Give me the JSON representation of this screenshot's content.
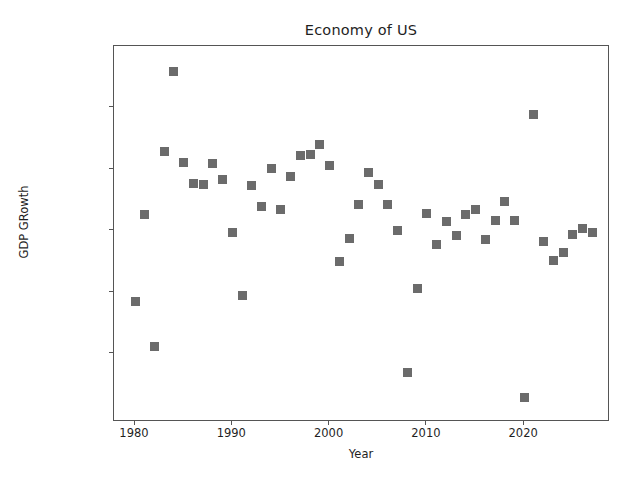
{
  "figure": {
    "background": "#ffffff",
    "marker_color": "#6b6b6b",
    "axis_color": "#555555",
    "text_color": "#1f1f1f"
  },
  "chart_data": {
    "type": "scatter",
    "title": "Economy of US",
    "xlabel": "Year",
    "ylabel": "GDP GRowth",
    "grid": false,
    "legend": null,
    "xlim": [
      1978.3,
      1978.3
    ],
    "ylim": [
      -0.0395,
      0.0795
    ],
    "xticks": [
      1980,
      1990,
      2000,
      2010,
      2020
    ],
    "xticklabels": [
      "1980",
      "1990",
      "2000",
      "2010",
      "2020"
    ],
    "yticks": [
      0.06,
      0.04,
      0.02,
      0.0,
      -0.02
    ],
    "yticklabels": [
      "0.06",
      "0.04",
      "0.02",
      "0.00",
      "−0.02"
    ],
    "marker": "square",
    "marker_size": 9,
    "x": [
      1980,
      1981,
      1982,
      1983,
      1984,
      1985,
      1986,
      1987,
      1988,
      1989,
      1990,
      1991,
      1992,
      1993,
      1994,
      1995,
      1996,
      1997,
      1998,
      1999,
      2000,
      2001,
      2002,
      2003,
      2004,
      2005,
      2006,
      2007,
      2008,
      2009,
      2010,
      2011,
      2012,
      2013,
      2014,
      2015,
      2016,
      2017,
      2018,
      2019,
      2020,
      2021,
      2022,
      2023,
      2024,
      2025,
      2026,
      2027
    ],
    "y": [
      -0.003,
      0.0251,
      -0.0177,
      0.0457,
      0.0718,
      0.0422,
      0.0352,
      0.0351,
      0.0419,
      0.0368,
      0.0195,
      -0.001,
      0.0347,
      0.0279,
      0.0403,
      0.0268,
      0.0377,
      0.0445,
      0.0449,
      0.0479,
      0.0413,
      0.0099,
      0.0174,
      0.0285,
      0.039,
      0.0351,
      0.0285,
      0.0201,
      -0.0261,
      0.0012,
      0.0257,
      0.0155,
      0.0229,
      0.0184,
      0.0252,
      0.0268,
      0.0171,
      0.0234,
      0.0295,
      0.0233,
      -0.0345,
      0.0579,
      0.0165,
      0.0104,
      0.0129,
      0.0187,
      0.0207,
      0.0194
    ],
    "points": [
      {
        "year": 1980,
        "value": -0.003
      },
      {
        "year": 1981,
        "value": 0.0251
      },
      {
        "year": 1982,
        "value": -0.0177
      },
      {
        "year": 1983,
        "value": 0.0457
      },
      {
        "year": 1984,
        "value": 0.0718
      },
      {
        "year": 1985,
        "value": 0.0422
      },
      {
        "year": 1986,
        "value": 0.0352
      },
      {
        "year": 1987,
        "value": 0.0351
      },
      {
        "year": 1988,
        "value": 0.0419
      },
      {
        "year": 1989,
        "value": 0.0368
      },
      {
        "year": 1990,
        "value": 0.0195
      },
      {
        "year": 1991,
        "value": -0.001
      },
      {
        "year": 1992,
        "value": 0.0347
      },
      {
        "year": 1993,
        "value": 0.0279
      },
      {
        "year": 1994,
        "value": 0.0403
      },
      {
        "year": 1995,
        "value": 0.0268
      },
      {
        "year": 1996,
        "value": 0.0377
      },
      {
        "year": 1997,
        "value": 0.0445
      },
      {
        "year": 1998,
        "value": 0.0449
      },
      {
        "year": 1999,
        "value": 0.0479
      },
      {
        "year": 2000,
        "value": 0.0413
      },
      {
        "year": 2001,
        "value": 0.0099
      },
      {
        "year": 2002,
        "value": 0.0174
      },
      {
        "year": 2003,
        "value": 0.0285
      },
      {
        "year": 2004,
        "value": 0.039
      },
      {
        "year": 2005,
        "value": 0.0351
      },
      {
        "year": 2006,
        "value": 0.0285
      },
      {
        "year": 2007,
        "value": 0.0201
      },
      {
        "year": 2008,
        "value": -0.0261
      },
      {
        "year": 2009,
        "value": 0.0012
      },
      {
        "year": 2010,
        "value": 0.0257
      },
      {
        "year": 2011,
        "value": 0.0155
      },
      {
        "year": 2012,
        "value": 0.0229
      },
      {
        "year": 2013,
        "value": 0.0184
      },
      {
        "year": 2014,
        "value": 0.0252
      },
      {
        "year": 2015,
        "value": 0.0268
      },
      {
        "year": 2016,
        "value": 0.0171
      },
      {
        "year": 2017,
        "value": 0.0234
      },
      {
        "year": 2018,
        "value": 0.0295
      },
      {
        "year": 2019,
        "value": 0.0233
      },
      {
        "year": 2020,
        "value": -0.0345
      },
      {
        "year": 2021,
        "value": 0.0579
      },
      {
        "year": 2022,
        "value": 0.0165
      },
      {
        "year": 2023,
        "value": 0.0104
      },
      {
        "year": 2024,
        "value": 0.0129
      },
      {
        "year": 2025,
        "value": 0.0187
      },
      {
        "year": 2026,
        "value": 0.0207
      },
      {
        "year": 2027,
        "value": 0.0194
      }
    ]
  }
}
